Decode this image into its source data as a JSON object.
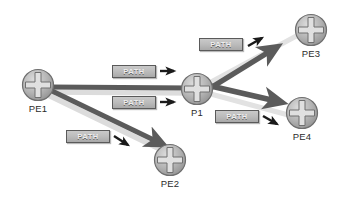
{
  "diagram": {
    "background": "#ffffff",
    "colors": {
      "dark_link": "#5b5b5b",
      "light_link": "#d8d8d8",
      "node_fill": "#b0b0b0",
      "node_stroke": "#6f6f6f",
      "label_text": "#2b2b2b",
      "path_box_fill": "#bdbdbd",
      "path_box_border": "#5a5a5a",
      "path_box_text": "#efefef",
      "arrow_marker": "#1a1a1a"
    },
    "nodes": [
      {
        "id": "pe1",
        "label": "PE1",
        "icon": "router-icon",
        "x": 21,
        "y": 68
      },
      {
        "id": "p1",
        "label": "P1",
        "icon": "router-icon",
        "x": 180,
        "y": 72
      },
      {
        "id": "pe3",
        "label": "PE3",
        "icon": "router-icon",
        "x": 294,
        "y": 13
      },
      {
        "id": "pe4",
        "label": "PE4",
        "icon": "router-icon",
        "x": 285,
        "y": 96
      },
      {
        "id": "pe2",
        "label": "PE2",
        "icon": "router-icon",
        "x": 153,
        "y": 143
      }
    ],
    "links": [
      {
        "id": "pe1-p1-dark",
        "from": "PE1",
        "to": "P1",
        "style": "thick-dark-arrow"
      },
      {
        "id": "pe1-pe2-dark",
        "from": "PE1",
        "to": "PE2",
        "style": "thick-dark-arrow"
      },
      {
        "id": "p1-pe3-dark",
        "from": "P1",
        "to": "PE3",
        "style": "thick-dark-arrow"
      },
      {
        "id": "p1-pe4-dark",
        "from": "P1",
        "to": "PE4",
        "style": "thick-dark-arrow"
      },
      {
        "id": "pe1-p1-light",
        "from": "PE1",
        "to": "P1",
        "style": "thick-light"
      },
      {
        "id": "pe1-pe2-light",
        "from": "PE1",
        "to": "PE2",
        "style": "thick-light"
      },
      {
        "id": "p1-pe3-light",
        "from": "P1",
        "to": "PE3",
        "style": "thick-light"
      },
      {
        "id": "p1-pe4-light",
        "from": "P1",
        "to": "PE4",
        "style": "thick-light"
      }
    ],
    "path_labels": [
      {
        "id": "path-pe1-p1-upper",
        "text": "PATH",
        "x": 112,
        "y": 65,
        "arrow": "right"
      },
      {
        "id": "path-pe1-p1-lower",
        "text": "PATH",
        "x": 112,
        "y": 96,
        "arrow": "right"
      },
      {
        "id": "path-p1-pe3",
        "text": "PATH",
        "x": 199,
        "y": 38,
        "arrow": "up-right"
      },
      {
        "id": "path-p1-pe4",
        "text": "PATH",
        "x": 215,
        "y": 110,
        "arrow": "down-right"
      },
      {
        "id": "path-pe1-pe2",
        "text": "PATH",
        "x": 66,
        "y": 130,
        "arrow": "down-right"
      }
    ]
  }
}
